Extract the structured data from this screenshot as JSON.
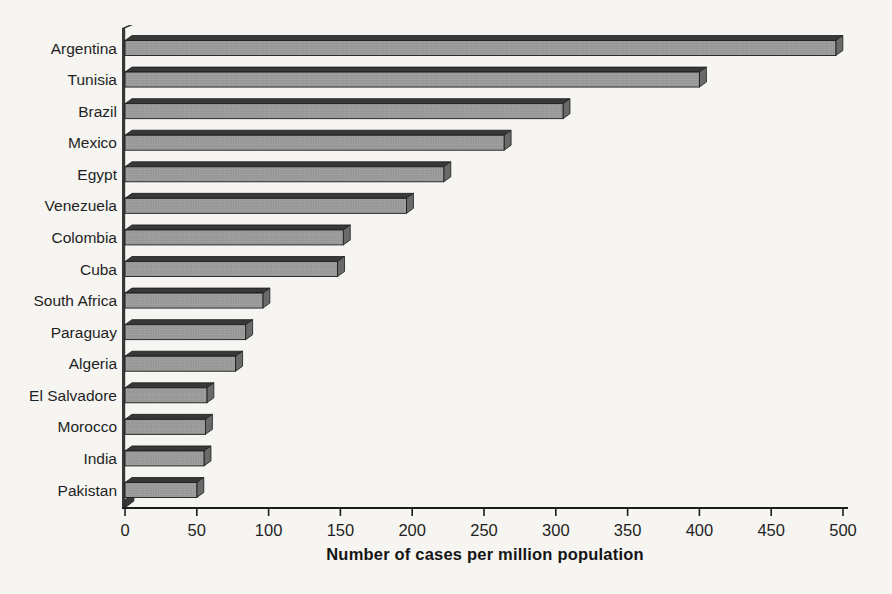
{
  "chart_data": {
    "type": "bar",
    "orientation": "horizontal",
    "title": "",
    "xlabel": "Number of cases per million population",
    "ylabel": "",
    "categories": [
      "Argentina",
      "Tunisia",
      "Brazil",
      "Mexico",
      "Egypt",
      "Venezuela",
      "Colombia",
      "Cuba",
      "South Africa",
      "Paraguay",
      "Algeria",
      "El Salvadore",
      "Morocco",
      "India",
      "Pakistan"
    ],
    "values": [
      495,
      400,
      305,
      264,
      222,
      196,
      152,
      148,
      96,
      84,
      77,
      57,
      56,
      55,
      50
    ],
    "xlim": [
      0,
      500
    ],
    "xticks": [
      0,
      50,
      100,
      150,
      200,
      250,
      300,
      350,
      400,
      450,
      500
    ],
    "grid": false,
    "legend": false,
    "bar_style": "3d-bevel",
    "style": {
      "background": "#f6f5f2",
      "bar_fill": "#a0a0a0",
      "bar_dot": "#7f7f7f",
      "bar_top_face": "#383838",
      "bar_end_face": "#6a6a6a",
      "outline": "#1c1c1c",
      "text_color": "#1f1f1f"
    }
  }
}
